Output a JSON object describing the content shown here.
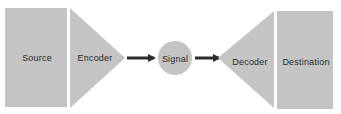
{
  "diagram": {
    "type": "communication-model",
    "colors": {
      "shape_fill": "#c4c4c4",
      "arrow": "#2e2e2e",
      "text": "#2a2a2a",
      "background": "#ffffff"
    },
    "nodes": [
      {
        "id": "source",
        "label": "Source",
        "shape": "rectangle"
      },
      {
        "id": "encoder",
        "label": "Encoder",
        "shape": "triangle-right"
      },
      {
        "id": "signal",
        "label": "Signal",
        "shape": "circle"
      },
      {
        "id": "decoder",
        "label": "Decoder",
        "shape": "triangle-left"
      },
      {
        "id": "destination",
        "label": "Destination",
        "shape": "rectangle"
      }
    ],
    "edges": [
      {
        "from": "encoder",
        "to": "signal"
      },
      {
        "from": "signal",
        "to": "decoder"
      }
    ]
  }
}
